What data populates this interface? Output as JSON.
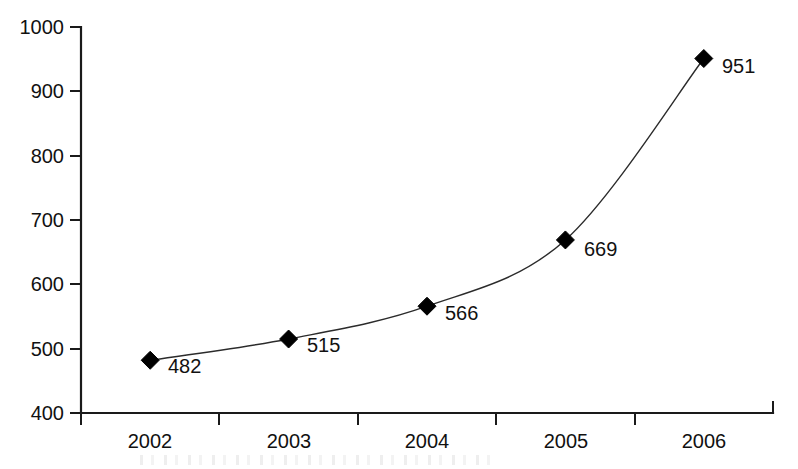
{
  "chart_data": {
    "type": "line",
    "title": "",
    "subtitle": "",
    "xlabel": "",
    "ylabel": "",
    "categories": [
      "2002",
      "2003",
      "2004",
      "2005",
      "2006"
    ],
    "values": [
      482,
      515,
      566,
      669,
      951
    ],
    "point_labels": [
      "482",
      "515",
      "566",
      "669",
      "951"
    ],
    "ylim": [
      400,
      1000
    ],
    "y_ticks": [
      400,
      500,
      600,
      700,
      800,
      900,
      1000
    ],
    "y_tick_labels": [
      "400",
      "500",
      "600",
      "700",
      "800",
      "900",
      "1000"
    ],
    "x_tick_labels": [
      "2002",
      "2003",
      "2004",
      "2005",
      "2006"
    ],
    "grid": false,
    "legend": false,
    "legend_position": "none",
    "marker": "diamond",
    "line_style": "smooth",
    "series": [
      {
        "name": "series-1",
        "values": [
          482,
          515,
          566,
          669,
          951
        ]
      }
    ],
    "colors": {
      "line": "#2b2b2b",
      "marker": "#000000",
      "axis": "#1a1a1a",
      "text": "#111111",
      "background": "#ffffff"
    }
  }
}
